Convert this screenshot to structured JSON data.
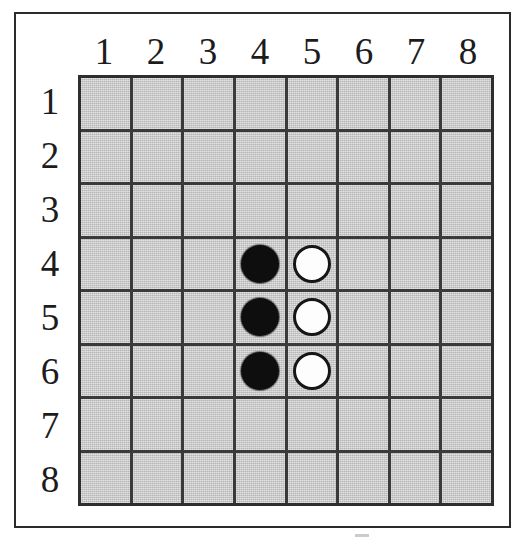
{
  "figure": {
    "kind": "othello-board-diagram",
    "frame_color": "#2b2b2b",
    "background_color": "#ffffff",
    "board": {
      "rows": 8,
      "columns": 8,
      "cell_fill_color": "#c6c6c6",
      "grid_line_color": "#2e2e2e",
      "black_disc_color": "#0e0e0e",
      "white_disc_color": "#fdfdfd",
      "white_disc_border_color": "#161616"
    }
  },
  "column_headers": [
    "1",
    "2",
    "3",
    "4",
    "5",
    "6",
    "7",
    "8"
  ],
  "row_headers": [
    "1",
    "2",
    "3",
    "4",
    "5",
    "6",
    "7",
    "8"
  ],
  "pieces": [
    {
      "column": 4,
      "row": 4,
      "color": "black"
    },
    {
      "column": 4,
      "row": 5,
      "color": "black"
    },
    {
      "column": 4,
      "row": 6,
      "color": "black"
    },
    {
      "column": 5,
      "row": 4,
      "color": "white"
    },
    {
      "column": 5,
      "row": 5,
      "color": "white"
    },
    {
      "column": 5,
      "row": 6,
      "color": "white"
    }
  ],
  "chart_data": {
    "type": "heatmap",
    "title": "",
    "xlabel": "",
    "ylabel": "",
    "columns": [
      "1",
      "2",
      "3",
      "4",
      "5",
      "6",
      "7",
      "8"
    ],
    "rows": [
      "1",
      "2",
      "3",
      "4",
      "5",
      "6",
      "7",
      "8"
    ],
    "legend": [
      "black",
      "white",
      "empty"
    ],
    "grid": [
      [
        "empty",
        "empty",
        "empty",
        "empty",
        "empty",
        "empty",
        "empty",
        "empty"
      ],
      [
        "empty",
        "empty",
        "empty",
        "empty",
        "empty",
        "empty",
        "empty",
        "empty"
      ],
      [
        "empty",
        "empty",
        "empty",
        "empty",
        "empty",
        "empty",
        "empty",
        "empty"
      ],
      [
        "empty",
        "empty",
        "empty",
        "black",
        "white",
        "empty",
        "empty",
        "empty"
      ],
      [
        "empty",
        "empty",
        "empty",
        "black",
        "white",
        "empty",
        "empty",
        "empty"
      ],
      [
        "empty",
        "empty",
        "empty",
        "black",
        "white",
        "empty",
        "empty",
        "empty"
      ],
      [
        "empty",
        "empty",
        "empty",
        "empty",
        "empty",
        "empty",
        "empty",
        "empty"
      ],
      [
        "empty",
        "empty",
        "empty",
        "empty",
        "empty",
        "empty",
        "empty",
        "empty"
      ]
    ],
    "counts": {
      "black": 3,
      "white": 3,
      "empty": 58
    }
  }
}
